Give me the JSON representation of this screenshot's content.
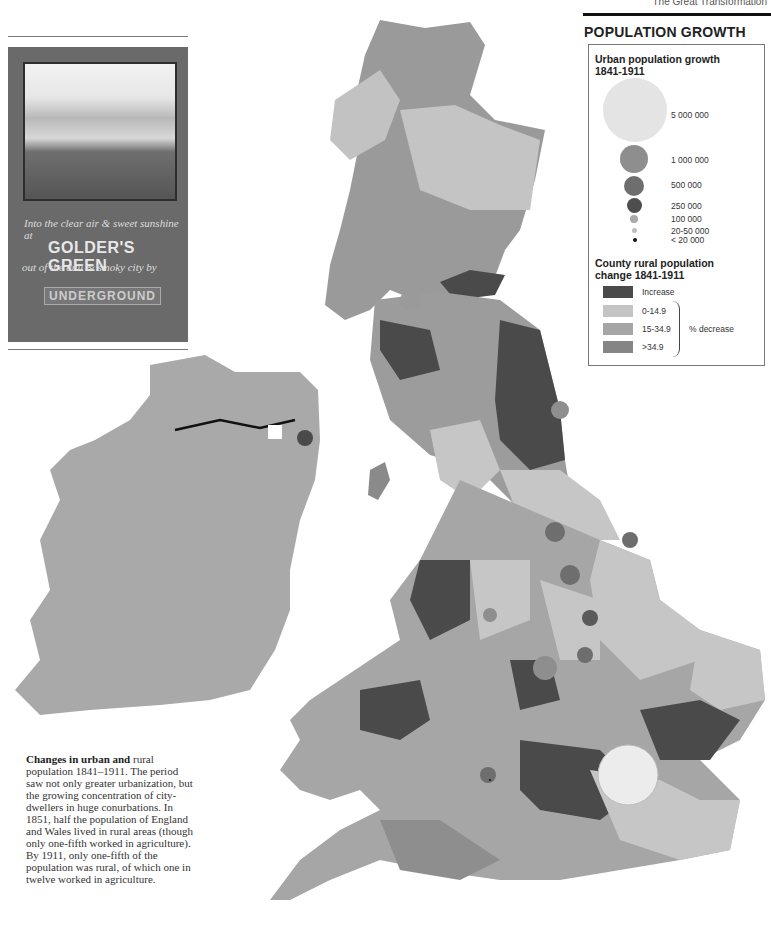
{
  "header": {
    "running_head": "The Great Transformation"
  },
  "legend": {
    "title": "POPULATION GROWTH",
    "urban_heading_line1": "Urban population growth",
    "urban_heading_line2": "1841-1911",
    "urban_sizes": [
      {
        "label": "5 000 000",
        "color": "#e4e4e4"
      },
      {
        "label": "1 000 000",
        "color": "#8e8e8e"
      },
      {
        "label": "500 000",
        "color": "#6e6e6e"
      },
      {
        "label": "250 000",
        "color": "#4e4e4e"
      },
      {
        "label": "100 000",
        "color": "#a8a8a8"
      },
      {
        "label": "20-50 000",
        "color": "#bdbdbd"
      },
      {
        "label": "< 20 000",
        "color": "#111111"
      }
    ],
    "rural_heading_line1": "County rural population",
    "rural_heading_line2": "change 1841-1911",
    "rural_classes": [
      {
        "label": "Increase",
        "color": "#4a4a4a"
      },
      {
        "label": "0-14.9",
        "color": "#c4c4c4"
      },
      {
        "label": "15-34.9",
        "color": "#a6a6a6"
      },
      {
        "label": ">34.9",
        "color": "#858585"
      }
    ],
    "decrease_label": "% decrease"
  },
  "poster": {
    "line1": "Into the clear air & sweet sunshine at",
    "line2": "GOLDER'S GREEN",
    "line3": "out of the dull & smoky city by",
    "line4": "UNDERGROUND"
  },
  "caption": {
    "lead": "Changes in urban and",
    "body": "rural population 1841–1911. The period saw not only greater urbanization, but the growing concentration of city-dwellers in huge conurbations. In 1851, half the population of England and Wales lived in rural areas (though only one-fifth worked in agriculture). By 1911, only one-fifth of the population was rural, of which one in twelve worked in agriculture."
  }
}
